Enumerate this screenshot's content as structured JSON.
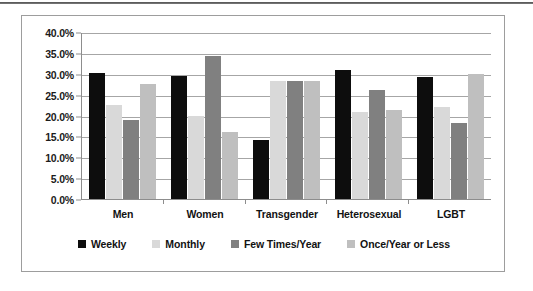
{
  "chart_data": {
    "type": "bar",
    "title": "",
    "subtitle": "",
    "xlabel": "",
    "ylabel": "",
    "ylim": [
      0,
      40
    ],
    "ytick_labels": [
      "0.0%",
      "5.0%",
      "10.0%",
      "15.0%",
      "20.0%",
      "25.0%",
      "30.0%",
      "35.0%",
      "40.0%"
    ],
    "ytick_values": [
      0,
      5,
      10,
      15,
      20,
      25,
      30,
      35,
      40
    ],
    "grid": "horizontal",
    "legend_position": "bottom",
    "value_suffix": "%",
    "categories": [
      "Men",
      "Women",
      "Transgender",
      "Heterosexual",
      "LGBT"
    ],
    "series": [
      {
        "name": "Weekly",
        "color": "#0d0d0d",
        "values": [
          30.3,
          29.7,
          14.2,
          31.2,
          29.5
        ]
      },
      {
        "name": "Monthly",
        "color": "#d9d9d9",
        "values": [
          22.7,
          20.1,
          28.5,
          20.9,
          22.1
        ]
      },
      {
        "name": "Few Times/Year",
        "color": "#808080",
        "values": [
          19.1,
          34.4,
          28.5,
          26.2,
          18.2
        ]
      },
      {
        "name": "Once/Year or Less",
        "color": "#bfbfbf",
        "values": [
          27.7,
          16.1,
          28.5,
          21.5,
          30.1
        ]
      }
    ]
  },
  "style": {
    "frame_border_color": "#9d9d9d",
    "gridline_color": "#a6a6a6",
    "axis_color": "#8d8d8d",
    "text_color": "#121212",
    "background": "#ffffff",
    "top_rule_color": "#4a4a4a"
  }
}
